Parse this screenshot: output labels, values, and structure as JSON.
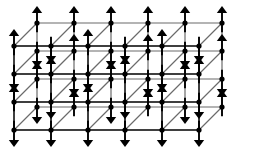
{
  "figure": {
    "name": "three-dimensional-spin-lattice",
    "title": "3D cubic spin lattice with up and down spins",
    "type": "line-art-diagram",
    "width": 262,
    "height": 147,
    "background_color": "#ffffff",
    "line_color": "#000000",
    "receding_line_color": "#6b6b6b",
    "arrow_color": "#000000",
    "site_dot_color": "#000000"
  },
  "geometry": {
    "columns": 6,
    "rows": 4,
    "depth_layers": 2,
    "column_spacing": 37,
    "row_spacing": 28,
    "depth_offset_x": 23,
    "depth_offset_y": -23,
    "front_origin_x": 14,
    "front_origin_y": 46,
    "site_dot_radius": 2.6,
    "arrow_length": 17,
    "arrow_head_width": 5.2,
    "arrow_head_length": 7,
    "arrow_shaft_width": 1.9,
    "edge_width_front": 1.5,
    "edge_width_back": 1.2
  },
  "spins": {
    "legend": "1 = up arrow, -1 = down arrow",
    "layer_front": [
      [
        1,
        -1,
        1,
        -1,
        1,
        -1
      ],
      [
        -1,
        1,
        -1,
        1,
        -1,
        1
      ],
      [
        1,
        -1,
        1,
        -1,
        1,
        -1
      ],
      [
        -1,
        -1,
        -1,
        -1,
        -1,
        -1
      ]
    ],
    "layer_back": [
      [
        1,
        1,
        1,
        1,
        1,
        1
      ],
      [
        -1,
        1,
        -1,
        1,
        -1,
        1
      ],
      [
        1,
        -1,
        1,
        -1,
        1,
        -1
      ],
      [
        -1,
        1,
        -1,
        1,
        -1,
        1
      ]
    ]
  },
  "chart_data": {
    "type": "scatter",
    "title": "3D cubic spin lattice",
    "xlabel": "",
    "ylabel": "",
    "series": [
      {
        "name": "front-layer-spins",
        "values": [
          1,
          -1,
          1,
          -1,
          1,
          -1,
          -1,
          1,
          -1,
          1,
          -1,
          1,
          1,
          -1,
          1,
          -1,
          1,
          -1,
          -1,
          -1,
          -1,
          -1,
          -1,
          -1
        ]
      },
      {
        "name": "back-layer-spins",
        "values": [
          1,
          1,
          1,
          1,
          1,
          1,
          -1,
          1,
          -1,
          1,
          -1,
          1,
          1,
          -1,
          1,
          -1,
          1,
          -1,
          -1,
          1,
          -1,
          1,
          -1,
          1
        ]
      }
    ]
  }
}
